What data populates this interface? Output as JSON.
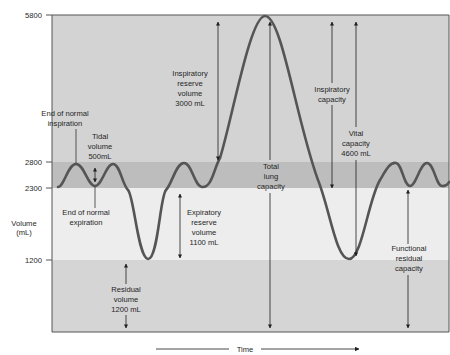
{
  "diagram": {
    "type": "spirogram",
    "axis": {
      "y_label_line1": "Volume",
      "y_label_line2": "(mL)",
      "x_label": "Time",
      "ticks": [
        {
          "value": "5800",
          "y": 15
        },
        {
          "value": "2800",
          "y": 162
        },
        {
          "value": "2300",
          "y": 188
        },
        {
          "value": "1200",
          "y": 260
        }
      ]
    },
    "bands": [
      {
        "name": "inspiratory-reserve-region",
        "from_ml": 5800,
        "to_ml": 2800,
        "color": "#d3d3d3"
      },
      {
        "name": "tidal-band",
        "from_ml": 2800,
        "to_ml": 2300,
        "color": "#bdbdbd"
      },
      {
        "name": "expiratory-reserve-band",
        "from_ml": 2300,
        "to_ml": 1200,
        "color": "#ededed"
      },
      {
        "name": "residual-band",
        "from_ml": 1200,
        "to_ml": 0,
        "color": "#d5d5d5"
      }
    ],
    "curve_color": "#555555",
    "labels": {
      "end_insp_1": "End of normal",
      "end_insp_2": "inspiration",
      "tidal_1": "Tidal",
      "tidal_2": "volume",
      "tidal_3": "500mL",
      "end_exp_1": "End of normal",
      "end_exp_2": "expiration",
      "irv_1": "Inspiratory",
      "irv_2": "reserve",
      "irv_3": "volume",
      "irv_4": "3000 mL",
      "erv_1": "Expiratory",
      "erv_2": "reserve",
      "erv_3": "volume",
      "erv_4": "1100 mL",
      "rv_1": "Residual",
      "rv_2": "volume",
      "rv_3": "1200 mL",
      "tlc_1": "Total",
      "tlc_2": "lung",
      "tlc_3": "capacity",
      "ic_1": "Inspiratory",
      "ic_2": "capacity",
      "vc_1": "Vital",
      "vc_2": "capacity",
      "vc_3": "4600 mL",
      "frc_1": "Functional",
      "frc_2": "residual",
      "frc_3": "capacity"
    },
    "volumes": [
      {
        "name": "Tidal volume",
        "value_ml": 500
      },
      {
        "name": "Inspiratory reserve volume",
        "value_ml": 3000
      },
      {
        "name": "Expiratory reserve volume",
        "value_ml": 1100
      },
      {
        "name": "Residual volume",
        "value_ml": 1200
      },
      {
        "name": "Vital capacity",
        "value_ml": 4600
      },
      {
        "name": "Total lung capacity",
        "value_ml": 5800
      }
    ]
  }
}
